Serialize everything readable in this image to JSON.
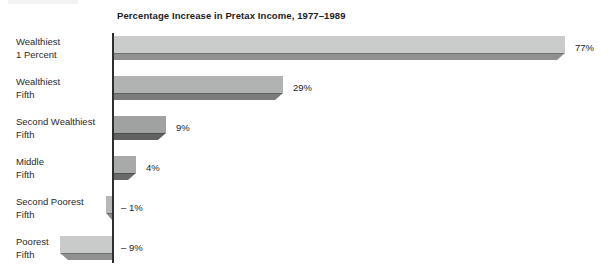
{
  "chart_data": {
    "type": "bar",
    "orientation": "horizontal",
    "title": "Percentage Increase in Pretax Income, 1977–1989",
    "xlabel": "",
    "ylabel": "",
    "xlim": [
      -10,
      80
    ],
    "grid": false,
    "legend": false,
    "axis_color": "#2e2e2e",
    "categories": [
      "Wealthiest 1 Percent",
      "Wealthiest Fifth",
      "Second Wealthiest Fifth",
      "Middle Fifth",
      "Second Poorest Fifth",
      "Poorest Fifth"
    ],
    "values": [
      77,
      29,
      9,
      4,
      -1,
      -9
    ],
    "bars": [
      {
        "label_lines": [
          "Wealthiest",
          "1 Percent"
        ],
        "value": 77,
        "value_label": "77%",
        "face_color": "#cacccb",
        "band_color": "#8f918f"
      },
      {
        "label_lines": [
          "Wealthiest",
          "Fifth"
        ],
        "value": 29,
        "value_label": "29%",
        "face_color": "#b1b3b2",
        "band_color": "#7a7c7b"
      },
      {
        "label_lines": [
          "Second Wealthiest",
          "Fifth"
        ],
        "value": 9,
        "value_label": "9%",
        "face_color": "#a0a2a1",
        "band_color": "#606261"
      },
      {
        "label_lines": [
          "Middle",
          "Fifth"
        ],
        "value": 4,
        "value_label": "4%",
        "face_color": "#a8aaa9",
        "band_color": "#686a69"
      },
      {
        "label_lines": [
          "Second Poorest",
          "Fifth"
        ],
        "value": -1,
        "value_label": "– 1%",
        "face_color": "#b7b9b8",
        "band_color": "#8a8c8b"
      },
      {
        "label_lines": [
          "Poorest",
          "Fifth"
        ],
        "value": -9,
        "value_label": "– 9%",
        "face_color": "#c9cbca",
        "band_color": "#8f918f"
      }
    ]
  }
}
